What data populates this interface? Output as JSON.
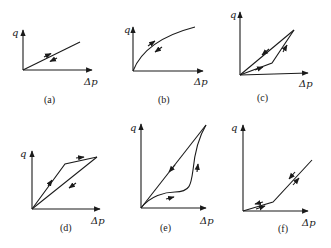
{
  "figure": {
    "y_axis_label": "q",
    "x_axis_label": "Δp",
    "panels": [
      {
        "id": "a",
        "caption": "(a)",
        "shape": "linear, same path loading/unloading"
      },
      {
        "id": "b",
        "caption": "(b)",
        "shape": "concave curve, same path loading/unloading"
      },
      {
        "id": "c",
        "caption": "(c)",
        "shape": "hysteresis loop: loading low bilinear path, unloading straight line"
      },
      {
        "id": "d",
        "caption": "(d)",
        "shape": "hysteresis loop: loading steep then flat, unloading straight line"
      },
      {
        "id": "e",
        "caption": "(e)",
        "shape": "hysteresis loop: curved loading path, straight unloading"
      },
      {
        "id": "f",
        "caption": "(f)",
        "shape": "bilinear, same path loading/unloading"
      }
    ]
  }
}
